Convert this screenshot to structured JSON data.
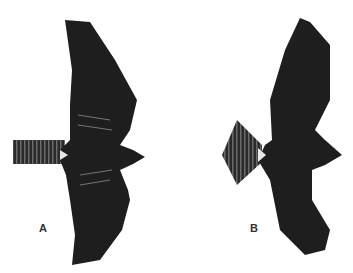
{
  "figure": {
    "panels": [
      {
        "label": "A",
        "subject": "raptor-in-flight-narrow-tail"
      },
      {
        "label": "B",
        "subject": "raptor-in-flight-fanned-tail"
      }
    ],
    "colors": {
      "bird": "#1e1e1e",
      "barring": "#5a5a5a",
      "highlight": "#e8e8e8",
      "background": "#ffffff"
    }
  }
}
